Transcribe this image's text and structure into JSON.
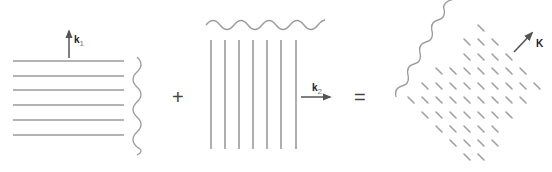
{
  "colors": {
    "line": "#9a9a9a",
    "arrow": "#555555",
    "text": "#222222",
    "operator": "#444444"
  },
  "panels": [
    {
      "id": "wave-1",
      "description": "horizontal wavefronts with wave propagating upward",
      "vector_label": "k",
      "vector_subscript": "1",
      "wavefront_count": 6,
      "orientation": "horizontal"
    },
    {
      "id": "wave-2",
      "description": "vertical wavefronts with wave propagating to the right",
      "vector_label": "k",
      "vector_subscript": "2",
      "wavefront_count": 7,
      "orientation": "vertical"
    },
    {
      "id": "sum-wave",
      "description": "diagonal interference lattice propagating up-right",
      "vector_label": "K",
      "orientation": "diagonal"
    }
  ],
  "operators": {
    "plus": "+",
    "equals": "="
  }
}
